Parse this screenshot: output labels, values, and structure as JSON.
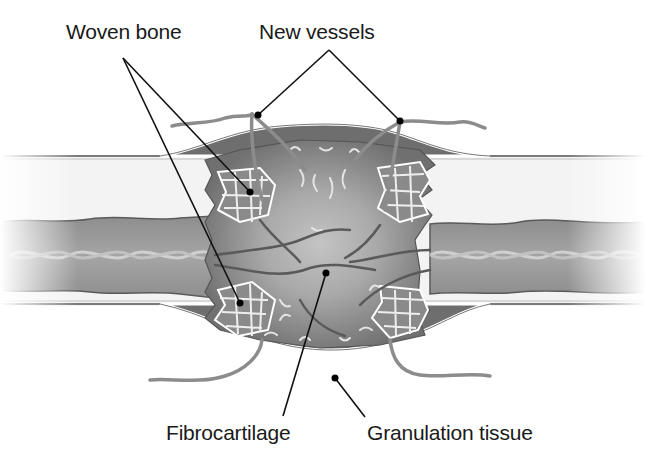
{
  "figure": {
    "palette": {
      "background": "#ffffff",
      "periosteum_line": "#6e6e6e",
      "cortex_fill": "#f1f1f1",
      "marrow_fill": "#9a9a9a",
      "callus_dark": "#6f6f6f",
      "callus_mid": "#8d8d8d",
      "fibrocartilage": "#b9b9b9",
      "woven_bone": "#e8e8e8",
      "vessel": "#5f5f5f",
      "leader_line": "#111111"
    }
  },
  "labels": {
    "woven_bone": "Woven bone",
    "new_vessels": "New vessels",
    "fibrocartilage": "Fibrocartilage",
    "granulation_tissue": "Granulation tissue"
  }
}
